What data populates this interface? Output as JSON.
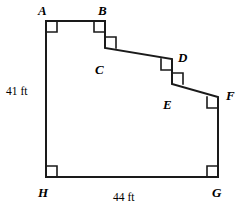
{
  "figure": {
    "shape_type": "irregular-octagon-staircase",
    "stroke_color": "#1a1a1a",
    "background_color": "#ffffff",
    "stroke_width": 2,
    "right_angle_mark_size": 11,
    "right_angle_mark_stroke_width": 1.6,
    "vertices": [
      {
        "name": "A",
        "x": 46,
        "y": 21,
        "label": "A",
        "label_x": 38,
        "label_y": 4,
        "interior_dx": 1,
        "interior_dy": 1
      },
      {
        "name": "B",
        "x": 105,
        "y": 21,
        "label": "B",
        "label_x": 98,
        "label_y": 4,
        "interior_dx": -1,
        "interior_dy": 1
      },
      {
        "name": "C",
        "x": 105,
        "y": 48,
        "label": "C",
        "label_x": 95,
        "label_y": 63,
        "interior_dx": 1,
        "interior_dy": -1
      },
      {
        "name": "D",
        "x": 172,
        "y": 59,
        "label": "D",
        "label_x": 178,
        "label_y": 51,
        "interior_dx": -1,
        "interior_dy": 1
      },
      {
        "name": "E",
        "x": 172,
        "y": 84,
        "label": "E",
        "label_x": 163,
        "label_y": 98,
        "interior_dx": 1,
        "interior_dy": -1
      },
      {
        "name": "F",
        "x": 218,
        "y": 97,
        "label": "F",
        "label_x": 226,
        "label_y": 89,
        "interior_dx": -1,
        "interior_dy": 1
      },
      {
        "name": "G",
        "x": 218,
        "y": 177,
        "label": "G",
        "label_x": 212,
        "label_y": 186,
        "interior_dx": -1,
        "interior_dy": -1
      },
      {
        "name": "H",
        "x": 46,
        "y": 177,
        "label": "H",
        "label_x": 38,
        "label_y": 186,
        "interior_dx": 1,
        "interior_dy": -1
      }
    ],
    "dimensions": [
      {
        "name": "left-side",
        "text": "41 ft",
        "x": 6,
        "y": 86,
        "side": "A-H"
      },
      {
        "name": "bottom-side",
        "text": "44 ft",
        "x": 113,
        "y": 192,
        "side": "H-G"
      }
    ]
  }
}
